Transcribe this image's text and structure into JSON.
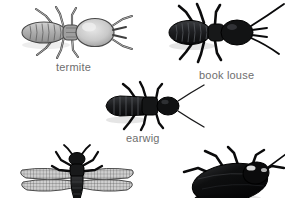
{
  "page": {
    "background_color": "#ffffff",
    "width": 285,
    "height": 198,
    "caption_color": "#6e6e6e"
  },
  "figures": [
    {
      "id": "termite",
      "label": "termite",
      "icon": "termite-insect-icon",
      "orientation": "dorsal view, head to the right",
      "tone": "light gray with white highlights",
      "body_color": "#a8a8a8",
      "outline_color": "#4a4a4a",
      "labeled": true,
      "cropped": false
    },
    {
      "id": "book-louse",
      "label": "book louse",
      "icon": "book-louse-insect-icon",
      "orientation": "dorsal view, head to the right",
      "tone": "near black with long antennae",
      "body_color": "#17181a",
      "outline_color": "#000000",
      "labeled": true,
      "cropped": false
    },
    {
      "id": "earwig",
      "label": "earwig",
      "icon": "earwig-insect-icon",
      "orientation": "dorsal view, head to the right",
      "tone": "dark charcoal, segmented abdomen",
      "body_color": "#1b1c1e",
      "outline_color": "#000000",
      "labeled": true,
      "cropped": false
    },
    {
      "id": "lacewing",
      "label": "",
      "icon": "lacewing-insect-icon",
      "orientation": "dorsal view, head upward, four net-veined wings spread",
      "tone": "dark body with pale mesh-patterned wings",
      "body_color": "#141414",
      "outline_color": "#000000",
      "labeled": false,
      "cropped": true
    },
    {
      "id": "cockroach",
      "label": "",
      "icon": "cockroach-insect-icon",
      "orientation": "dorsal view, head to the right, body angled",
      "tone": "glossy black oval body",
      "body_color": "#0d0d0d",
      "outline_color": "#000000",
      "labeled": false,
      "cropped": true
    }
  ]
}
